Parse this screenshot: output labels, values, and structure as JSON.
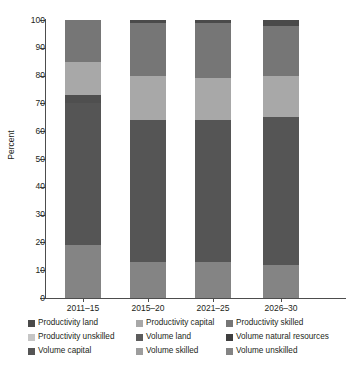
{
  "axes": {
    "ylabel": "Percent",
    "yticks": [
      0,
      10,
      20,
      30,
      40,
      50,
      60,
      70,
      80,
      90,
      100
    ],
    "ylim": [
      0,
      100
    ],
    "xticklabels": [
      "2011–15",
      "2015–20",
      "2021–25",
      "2026–30"
    ]
  },
  "legend": {
    "rows": [
      [
        {
          "label": "Productivity land",
          "color": "#4a4a4a",
          "key": "productivity-land"
        },
        {
          "label": "Productivity capital",
          "color": "#a8a8a8",
          "key": "productivity-capital"
        },
        {
          "label": "Productivity skilled",
          "color": "#767676",
          "key": "productivity-skilled"
        }
      ],
      [
        {
          "label": "Productivity unskilled",
          "color": "#c6c6c6",
          "key": "productivity-unskilled"
        },
        {
          "label": "Volume land",
          "color": "#5c5c5c",
          "key": "volume-land"
        },
        {
          "label": "Volume natural resources",
          "color": "#3f3f3f",
          "key": "volume-natural-resources"
        }
      ],
      [
        {
          "label": "Volume capital",
          "color": "#555555",
          "key": "volume-capital"
        },
        {
          "label": "Volume skilled",
          "color": "#9d9d9d",
          "key": "volume-skilled"
        },
        {
          "label": "Volume unskilled",
          "color": "#848484",
          "key": "volume-unskilled"
        }
      ]
    ]
  },
  "chart_data": {
    "type": "bar",
    "stacked": true,
    "title": "",
    "xlabel": "",
    "ylabel": "Percent",
    "ylim": [
      0,
      100
    ],
    "grid": false,
    "legend_position": "bottom",
    "categories": [
      "2011–15",
      "2015–20",
      "2021–25",
      "2026–30"
    ],
    "series": [
      {
        "name": "Volume unskilled",
        "color": "#848484",
        "values": [
          19,
          13,
          13,
          12
        ]
      },
      {
        "name": "Volume capital",
        "color": "#555555",
        "values": [
          51,
          51,
          51,
          53
        ]
      },
      {
        "name": "Volume land",
        "color": "#5c5c5c",
        "values": [
          3,
          0,
          0,
          0
        ]
      },
      {
        "name": "Productivity capital",
        "color": "#a8a8a8",
        "values": [
          12,
          16,
          15,
          15
        ]
      },
      {
        "name": "Productivity skilled",
        "color": "#767676",
        "values": [
          15,
          19,
          20,
          18
        ]
      },
      {
        "name": "Productivity land",
        "color": "#4a4a4a",
        "values": [
          0,
          1,
          1,
          2
        ]
      }
    ],
    "stacks": [
      {
        "category": "2011–15",
        "segments": [
          {
            "name": "Volume unskilled",
            "from": 0,
            "to": 19,
            "color": "#848484"
          },
          {
            "name": "Volume capital",
            "from": 19,
            "to": 70,
            "color": "#555555"
          },
          {
            "name": "Volume land",
            "from": 70,
            "to": 73,
            "color": "#4f4f4f"
          },
          {
            "name": "Productivity capital",
            "from": 73,
            "to": 85,
            "color": "#a8a8a8"
          },
          {
            "name": "Productivity skilled",
            "from": 85,
            "to": 100,
            "color": "#767676"
          }
        ]
      },
      {
        "category": "2015–20",
        "segments": [
          {
            "name": "Volume unskilled",
            "from": 0,
            "to": 13,
            "color": "#848484"
          },
          {
            "name": "Volume capital",
            "from": 13,
            "to": 64,
            "color": "#555555"
          },
          {
            "name": "Productivity capital",
            "from": 64,
            "to": 80,
            "color": "#a8a8a8"
          },
          {
            "name": "Productivity skilled",
            "from": 80,
            "to": 99,
            "color": "#767676"
          },
          {
            "name": "Productivity land",
            "from": 99,
            "to": 100,
            "color": "#4a4a4a"
          }
        ]
      },
      {
        "category": "2021–25",
        "segments": [
          {
            "name": "Volume unskilled",
            "from": 0,
            "to": 13,
            "color": "#848484"
          },
          {
            "name": "Volume capital",
            "from": 13,
            "to": 64,
            "color": "#555555"
          },
          {
            "name": "Productivity capital",
            "from": 64,
            "to": 79,
            "color": "#a8a8a8"
          },
          {
            "name": "Productivity skilled",
            "from": 79,
            "to": 99,
            "color": "#767676"
          },
          {
            "name": "Productivity land",
            "from": 99,
            "to": 100,
            "color": "#4a4a4a"
          }
        ]
      },
      {
        "category": "2026–30",
        "segments": [
          {
            "name": "Volume unskilled",
            "from": 0,
            "to": 12,
            "color": "#848484"
          },
          {
            "name": "Volume capital",
            "from": 12,
            "to": 65,
            "color": "#555555"
          },
          {
            "name": "Productivity capital",
            "from": 65,
            "to": 80,
            "color": "#a8a8a8"
          },
          {
            "name": "Productivity skilled",
            "from": 80,
            "to": 98,
            "color": "#767676"
          },
          {
            "name": "Productivity land",
            "from": 98,
            "to": 100,
            "color": "#4a4a4a"
          }
        ]
      }
    ]
  }
}
